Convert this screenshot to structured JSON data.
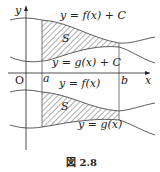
{
  "figure": {
    "caption": "図 2.8",
    "axes": {
      "x_label": "x",
      "y_label": "y",
      "origin_label": "O",
      "a_label": "a",
      "b_label": "b"
    },
    "upper": {
      "curve_top_label": "y = f(x) + C",
      "curve_bottom_label": "y = g(x) + C",
      "region_label": "S"
    },
    "lower": {
      "curve_top_label": "y = f(x)",
      "curve_bottom_label": "y = g(x)",
      "region_label": "S"
    }
  }
}
